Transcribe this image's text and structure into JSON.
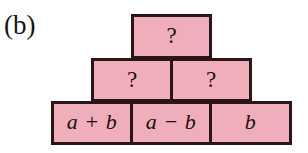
{
  "figure": {
    "label": "(b)",
    "fill_color": "#efaeb9",
    "border_color": "#2a1518",
    "text_color": "#1b1010",
    "background_color": "#ffffff"
  },
  "pyramid": {
    "rows": [
      {
        "name": "top-row",
        "blocks": [
          {
            "text": "?",
            "kind": "unknown"
          }
        ]
      },
      {
        "name": "middle-row",
        "blocks": [
          {
            "text": "?",
            "kind": "unknown"
          },
          {
            "text": "?",
            "kind": "unknown"
          }
        ]
      },
      {
        "name": "bottom-row",
        "blocks": [
          {
            "text": "a + b",
            "kind": "expression"
          },
          {
            "text": "a − b",
            "kind": "expression"
          },
          {
            "text": "b",
            "kind": "expression"
          }
        ]
      }
    ]
  }
}
